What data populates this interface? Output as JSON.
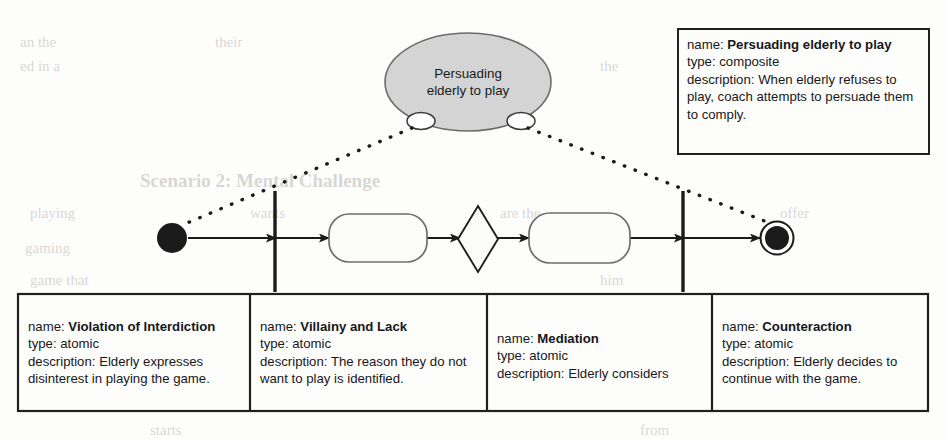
{
  "diagram": {
    "type": "uml-activity-diagram",
    "title_node": {
      "label_line_1": "Persuading",
      "label_line_2": "elderly to play",
      "shape": "ellipse",
      "fill": "#d4d4d4",
      "stroke": "#5a5a5a"
    },
    "colors": {
      "ink": "#17171a",
      "node_fill": "#d4d4d4",
      "node_stroke": "#5a5a5a",
      "line": "#1b1b1b",
      "page": "#fdfdfc"
    },
    "flow": {
      "initial_node": "initial-node",
      "final_node": "final-node",
      "fork_bar_left": "partition-bar-left",
      "fork_bar_right": "partition-bar-right",
      "action_1": "",
      "action_2": "",
      "decision": "decision-diamond"
    }
  },
  "composite_note": {
    "name_label": "name:",
    "name_value": "Persuading elderly to play",
    "type_label": "type:",
    "type_value": "composite",
    "description_label": "description:",
    "description_value": "When elderly refuses to play, coach attempts to persuade them to comply."
  },
  "notes": [
    {
      "name_label": "name:",
      "name_value": "Violation of Interdiction",
      "type_label": "type:",
      "type_value": "atomic",
      "description_label": "description:",
      "description_value": "Elderly expresses disinterest in playing the game."
    },
    {
      "name_label": "name:",
      "name_value": "Villainy and Lack",
      "type_label": "type:",
      "type_value": "atomic",
      "description_label": "description:",
      "description_value": "The reason they do not want to play is identified."
    },
    {
      "name_label": "name:",
      "name_value": "Mediation",
      "type_label": "type:",
      "type_value": "atomic",
      "description_label": "description:",
      "description_value": "Elderly considers"
    },
    {
      "name_label": "name:",
      "name_value": "Counteraction",
      "type_label": "type:",
      "type_value": "atomic",
      "description_label": "description:",
      "description_value": "Elderly decides to continue with the game."
    }
  ],
  "background_text": {
    "l1": "an the",
    "l2": "ed in a",
    "l3": "their",
    "l4": "the",
    "l5": "Scenario 2: Mental Challenge",
    "l6": "playing",
    "l7": "wants",
    "l8": "are the",
    "l9": "gaming",
    "l10": "persuade",
    "l11": "game that",
    "l12": "him",
    "l13": "offer",
    "l14": "starts",
    "l15": "from"
  }
}
